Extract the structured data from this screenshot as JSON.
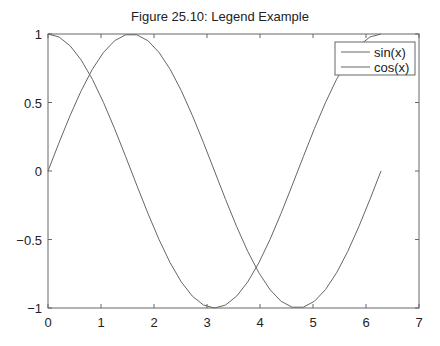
{
  "chart_data": {
    "type": "line",
    "title": "Figure 25.10: Legend Example",
    "xlabel": "",
    "ylabel": "",
    "xlim": [
      0,
      7
    ],
    "ylim": [
      -1,
      1
    ],
    "grid": false,
    "legend_position": "upper right",
    "xticks": [
      "0",
      "1",
      "2",
      "3",
      "4",
      "5",
      "6",
      "7"
    ],
    "yticks": [
      "1",
      "0.5",
      "0",
      "−0.5",
      "−1"
    ],
    "x": [
      0,
      0.2094,
      0.4189,
      0.6283,
      0.8378,
      1.0472,
      1.2566,
      1.4661,
      1.6755,
      1.885,
      2.0944,
      2.3038,
      2.5133,
      2.7227,
      2.9322,
      3.1416,
      3.351,
      3.5605,
      3.7699,
      3.9794,
      4.1888,
      4.3982,
      4.6077,
      4.8171,
      5.0265,
      5.236,
      5.4454,
      5.6549,
      5.8643,
      6.0737,
      6.2832
    ],
    "series": [
      {
        "name": "sin(x)",
        "color": "#666666",
        "values": [
          0,
          0.2079,
          0.4067,
          0.5878,
          0.7431,
          0.866,
          0.9511,
          0.9945,
          0.9945,
          0.9511,
          0.866,
          0.7431,
          0.5878,
          0.4067,
          0.2079,
          0,
          -0.2079,
          -0.4067,
          -0.5878,
          -0.7431,
          -0.866,
          -0.9511,
          -0.9945,
          -0.9945,
          -0.9511,
          -0.866,
          -0.7431,
          -0.5878,
          -0.4067,
          -0.2079,
          0
        ]
      },
      {
        "name": "cos(x)",
        "color": "#666666",
        "values": [
          1,
          0.9781,
          0.9135,
          0.809,
          0.6691,
          0.5,
          0.309,
          0.1045,
          -0.1045,
          -0.309,
          -0.5,
          -0.6691,
          -0.809,
          -0.9135,
          -0.9781,
          -1,
          -0.9781,
          -0.9135,
          -0.809,
          -0.6691,
          -0.5,
          -0.309,
          -0.1045,
          0.1045,
          0.309,
          0.5,
          0.6691,
          0.809,
          0.9135,
          0.9781,
          1
        ]
      }
    ]
  },
  "legend": {
    "items": [
      {
        "label": "sin(x)"
      },
      {
        "label": "cos(x)"
      }
    ]
  }
}
